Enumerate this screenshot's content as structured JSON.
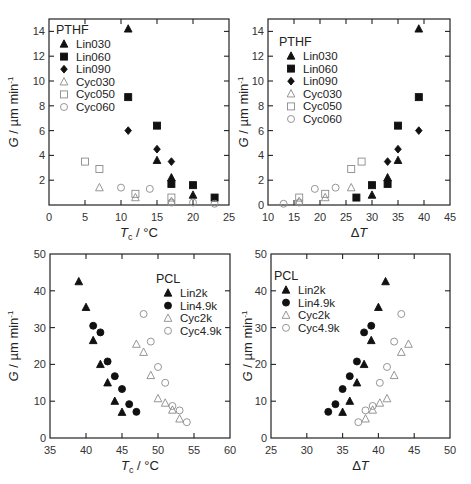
{
  "chart_data": [
    {
      "type": "scatter",
      "panel": "top-left",
      "title": "PTHF",
      "xlabel": "Tc / °C",
      "ylabel": "G / µm min⁻¹",
      "xlim": [
        0,
        25
      ],
      "ylim": [
        0,
        15
      ],
      "xticks": [
        0,
        5,
        10,
        15,
        20,
        25
      ],
      "yticks": [
        2,
        4,
        6,
        8,
        10,
        12,
        14
      ],
      "grid": false,
      "legend_position": "upper-left",
      "series": [
        {
          "name": "Lin030",
          "marker": "triangle",
          "filled": true,
          "points": [
            [
              11,
              14.2
            ],
            [
              15,
              3.6
            ],
            [
              17,
              2.2
            ],
            [
              20,
              0.8
            ]
          ]
        },
        {
          "name": "Lin060",
          "marker": "square",
          "filled": true,
          "points": [
            [
              11,
              8.7
            ],
            [
              15,
              6.4
            ],
            [
              17,
              1.7
            ],
            [
              20,
              1.6
            ],
            [
              23,
              0.6
            ]
          ]
        },
        {
          "name": "Lin090",
          "marker": "diamond",
          "filled": true,
          "points": [
            [
              11,
              6.0
            ],
            [
              15,
              4.5
            ],
            [
              17,
              3.5
            ]
          ]
        },
        {
          "name": "Cyc030",
          "marker": "triangle",
          "filled": false,
          "points": [
            [
              7,
              1.4
            ],
            [
              12,
              0.6
            ],
            [
              17,
              0.3
            ]
          ]
        },
        {
          "name": "Cyc050",
          "marker": "square",
          "filled": false,
          "points": [
            [
              5,
              3.5
            ],
            [
              7,
              2.9
            ],
            [
              12,
              0.9
            ],
            [
              17,
              0.6
            ]
          ]
        },
        {
          "name": "Cyc060",
          "marker": "circle",
          "filled": false,
          "points": [
            [
              10,
              1.4
            ],
            [
              14,
              1.3
            ],
            [
              17,
              0.2
            ],
            [
              20,
              0.2
            ],
            [
              23,
              0.1
            ]
          ]
        }
      ]
    },
    {
      "type": "scatter",
      "panel": "top-right",
      "title": "PTHF",
      "xlabel": "ΔT",
      "ylabel": "G / µm min⁻¹",
      "xlim": [
        10,
        45
      ],
      "ylim": [
        0,
        15
      ],
      "xticks": [
        10,
        15,
        20,
        25,
        30,
        35,
        40,
        45
      ],
      "yticks": [
        0,
        2,
        4,
        6,
        8,
        10,
        12,
        14
      ],
      "grid": false,
      "legend_position": "upper-left",
      "series": [
        {
          "name": "Lin030",
          "marker": "triangle",
          "filled": true,
          "points": [
            [
              39,
              14.2
            ],
            [
              35,
              3.6
            ],
            [
              33,
              2.2
            ],
            [
              30,
              0.8
            ]
          ]
        },
        {
          "name": "Lin060",
          "marker": "square",
          "filled": true,
          "points": [
            [
              39,
              8.7
            ],
            [
              35,
              6.4
            ],
            [
              33,
              1.7
            ],
            [
              30,
              1.6
            ],
            [
              27,
              0.6
            ]
          ]
        },
        {
          "name": "Lin090",
          "marker": "diamond",
          "filled": true,
          "points": [
            [
              39,
              6.0
            ],
            [
              35,
              4.5
            ],
            [
              33,
              3.5
            ]
          ]
        },
        {
          "name": "Cyc030",
          "marker": "triangle",
          "filled": false,
          "points": [
            [
              26,
              1.4
            ],
            [
              21,
              0.6
            ],
            [
              16,
              0.3
            ]
          ]
        },
        {
          "name": "Cyc050",
          "marker": "square",
          "filled": false,
          "points": [
            [
              28,
              3.5
            ],
            [
              26,
              2.9
            ],
            [
              21,
              0.9
            ],
            [
              16,
              0.6
            ]
          ]
        },
        {
          "name": "Cyc060",
          "marker": "circle",
          "filled": false,
          "points": [
            [
              23,
              1.4
            ],
            [
              19,
              1.3
            ],
            [
              16,
              0.2
            ],
            [
              13,
              0.1
            ]
          ]
        }
      ]
    },
    {
      "type": "scatter",
      "panel": "bottom-left",
      "title": "PCL",
      "xlabel": "Tc / °C",
      "ylabel": "G / µm min⁻¹",
      "xlim": [
        35,
        60
      ],
      "ylim": [
        0,
        50
      ],
      "xticks": [
        35,
        40,
        45,
        50,
        55,
        60
      ],
      "yticks": [
        0,
        10,
        20,
        30,
        40,
        50
      ],
      "grid": false,
      "legend_position": "upper-right",
      "series": [
        {
          "name": "Lin2k",
          "marker": "triangle",
          "filled": true,
          "points": [
            [
              39,
              42.5
            ],
            [
              40,
              35.5
            ],
            [
              41,
              26.5
            ],
            [
              42,
              20
            ],
            [
              43,
              15
            ],
            [
              44,
              10
            ],
            [
              45,
              7
            ]
          ]
        },
        {
          "name": "Lin4.9k",
          "marker": "circle",
          "filled": true,
          "points": [
            [
              41,
              30.5
            ],
            [
              42,
              28.7
            ],
            [
              43,
              20.8
            ],
            [
              44,
              16.8
            ],
            [
              45,
              13.3
            ],
            [
              46,
              9.2
            ],
            [
              47,
              7.1
            ]
          ]
        },
        {
          "name": "Cyc2k",
          "marker": "triangle",
          "filled": false,
          "points": [
            [
              47,
              25.5
            ],
            [
              48,
              23.3
            ],
            [
              49,
              17
            ],
            [
              50,
              10.7
            ],
            [
              51,
              9.5
            ],
            [
              52,
              7.6
            ],
            [
              53,
              5.2
            ]
          ]
        },
        {
          "name": "Cyc4.9k",
          "marker": "circle",
          "filled": false,
          "points": [
            [
              48,
              33.7
            ],
            [
              49,
              26.2
            ],
            [
              50,
              19.3
            ],
            [
              51,
              15
            ],
            [
              52,
              8.7
            ],
            [
              53,
              7.5
            ],
            [
              54,
              4.3
            ]
          ]
        }
      ]
    },
    {
      "type": "scatter",
      "panel": "bottom-right",
      "title": "PCL",
      "xlabel": "ΔT",
      "ylabel": "G / µm min⁻¹",
      "xlim": [
        25,
        50
      ],
      "ylim": [
        0,
        50
      ],
      "xticks": [
        25,
        30,
        35,
        40,
        45,
        50
      ],
      "yticks": [
        0,
        10,
        20,
        30,
        40,
        50
      ],
      "grid": false,
      "legend_position": "upper-left",
      "series": [
        {
          "name": "Lin2k",
          "marker": "triangle",
          "filled": true,
          "points": [
            [
              41,
              42.5
            ],
            [
              40,
              35.5
            ],
            [
              39,
              26.5
            ],
            [
              38,
              20
            ],
            [
              37,
              15
            ],
            [
              36,
              10
            ],
            [
              35,
              7
            ]
          ]
        },
        {
          "name": "Lin4.9k",
          "marker": "circle",
          "filled": true,
          "points": [
            [
              39,
              30.5
            ],
            [
              38,
              28.7
            ],
            [
              37,
              20.8
            ],
            [
              36,
              16.8
            ],
            [
              35,
              13.3
            ],
            [
              34,
              9.2
            ],
            [
              33,
              7.1
            ]
          ]
        },
        {
          "name": "Cyc2k",
          "marker": "triangle",
          "filled": false,
          "points": [
            [
              44.2,
              25.5
            ],
            [
              43.2,
              23.3
            ],
            [
              42.2,
              17
            ],
            [
              41.2,
              10.7
            ],
            [
              40.2,
              9.5
            ],
            [
              39.2,
              7.6
            ],
            [
              38.2,
              5.2
            ]
          ]
        },
        {
          "name": "Cyc4.9k",
          "marker": "circle",
          "filled": false,
          "points": [
            [
              43.2,
              33.7
            ],
            [
              42.2,
              26.2
            ],
            [
              41.2,
              19.3
            ],
            [
              40.2,
              15
            ],
            [
              39.2,
              8.7
            ],
            [
              38.2,
              7.5
            ],
            [
              37.2,
              4.3
            ]
          ]
        }
      ]
    }
  ],
  "panels": {
    "top_left": {
      "legend_title": "PTHF",
      "xlabel_main": "T",
      "xlabel_sub": "c",
      "xlabel_unit": "/ °C",
      "ylabel": "G / µm min",
      "ylabel_sup": "-1"
    },
    "top_right": {
      "legend_title": "PTHF",
      "xlabel": "ΔT",
      "ylabel": "G / µm min",
      "ylabel_sup": "-1"
    },
    "bottom_left": {
      "legend_title": "PCL",
      "xlabel_main": "T",
      "xlabel_sub": "c",
      "xlabel_unit": "/ °C",
      "ylabel": "G / µm min",
      "ylabel_sup": "-1"
    },
    "bottom_right": {
      "legend_title": "PCL",
      "xlabel": "ΔT",
      "ylabel": "G / µm min",
      "ylabel_sup": "-1"
    }
  },
  "colors": {
    "filled": "#111111",
    "open": "#8a8a8a",
    "axis": "#222222"
  }
}
